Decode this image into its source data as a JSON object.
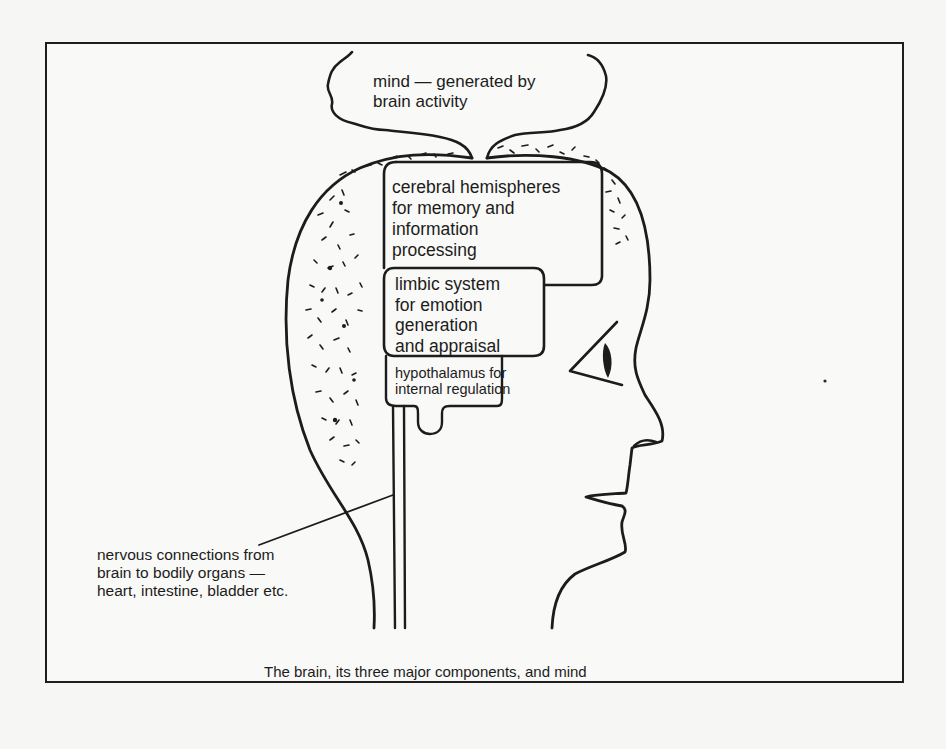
{
  "figure": {
    "caption": "The brain, its three major components, and mind",
    "labels": {
      "mind": "mind — generated by\nbrain activity",
      "cerebral_hemispheres": "cerebral hemispheres\nfor memory and\ninformation\nprocessing",
      "limbic_system": "limbic system\nfor emotion\ngeneration\nand appraisal",
      "hypothalamus": "hypothalamus for\ninternal regulation",
      "nervous_connections": "nervous connections from\nbrain to bodily organs —\nheart, intestine, bladder etc."
    },
    "components": [
      {
        "name": "cerebral hemispheres",
        "function": "memory and information processing"
      },
      {
        "name": "limbic system",
        "function": "emotion generation and appraisal"
      },
      {
        "name": "hypothalamus",
        "function": "internal regulation"
      }
    ],
    "colors": {
      "ink": "#1c1c1c",
      "paper": "#f8f8f6"
    }
  }
}
